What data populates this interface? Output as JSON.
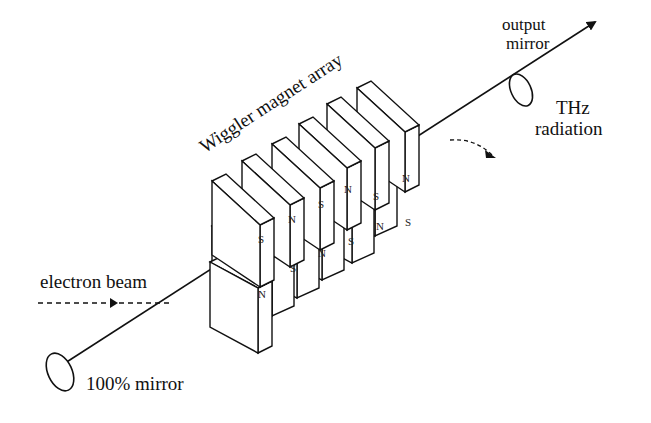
{
  "labels": {
    "wiggler": "Wiggler magnet array",
    "output_mirror_line1": "output",
    "output_mirror_line2": "mirror",
    "thz_line1": "THz",
    "thz_line2": "radiation",
    "electron_beam": "electron beam",
    "rear_mirror": "100% mirror"
  },
  "magnets": {
    "top_row_poles": [
      "S",
      "N",
      "S",
      "N",
      "S",
      "N"
    ],
    "bottom_row_poles": [
      "N",
      "S",
      "N",
      "S",
      "N",
      "S"
    ]
  },
  "colors": {
    "line": "#111111",
    "background": "#ffffff"
  }
}
